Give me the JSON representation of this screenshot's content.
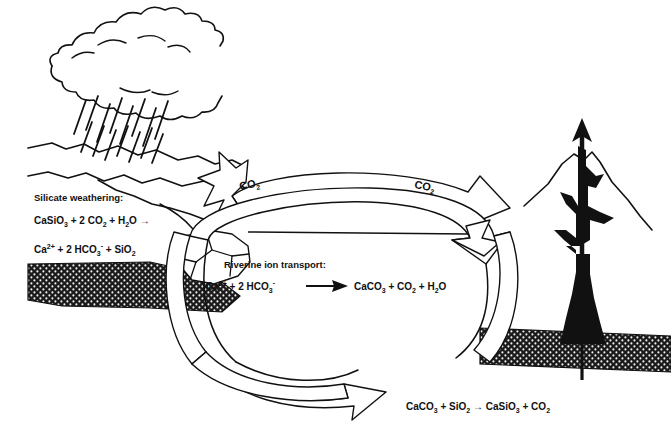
{
  "diagram": {
    "background_color": "#ffffff",
    "ink_color": "#111111"
  },
  "labels": {
    "silicate_weathering_heading": "Silicate weathering:",
    "silicate_eq_line1_a": "CaSiO",
    "silicate_eq_line1_a_sub": "3",
    "silicate_eq_line1_b": " + 2 CO",
    "silicate_eq_line1_b_sub": "2",
    "silicate_eq_line1_c": " + H",
    "silicate_eq_line1_c_sub": "2",
    "silicate_eq_line1_d": "O →",
    "silicate_eq_line2_a": "Ca",
    "silicate_eq_line2_a_sup": "2+",
    "silicate_eq_line2_b": " + 2 HCO",
    "silicate_eq_line2_b_sub": "3",
    "silicate_eq_line2_b_sup": "-",
    "silicate_eq_line2_c": " + SiO",
    "silicate_eq_line2_c_sub": "2",
    "riverine_heading": "Riverine ion transport:",
    "riverine_eq_a": "Ca",
    "riverine_eq_a_sup": "2+",
    "riverine_eq_b": " + 2 HCO",
    "riverine_eq_b_sub": "3",
    "riverine_eq_b_sup": "-",
    "riverine_eq_c": "CaCO",
    "riverine_eq_c_sub": "3",
    "riverine_eq_d": " + CO",
    "riverine_eq_d_sub": "2",
    "riverine_eq_e": " + H",
    "riverine_eq_e_sub": "2",
    "riverine_eq_f": "O",
    "metamorphism_eq_a": "CaCO",
    "metamorphism_eq_a_sub": "3",
    "metamorphism_eq_b": " + SiO",
    "metamorphism_eq_b_sub": "2",
    "metamorphism_eq_c": " → CaSiO",
    "metamorphism_eq_c_sub": "3",
    "metamorphism_eq_d": " + CO",
    "metamorphism_eq_d_sub": "2",
    "co2_left": "CO",
    "co2_left_sub": "2",
    "co2_right": "CO",
    "co2_right_sub": "2"
  },
  "features": {
    "cloud": "rain-cloud",
    "rain": "rain-streaks",
    "land_left": "weathering-landscape",
    "sediment_left": "seafloor-sediment-wedge",
    "sediment_right": "seafloor-sediment-band",
    "outcrop": "cracked-rock-outcrop",
    "volcano": "volcano-with-magma-conduit",
    "outgassing_arrow": "volcanic-outgassing-arrow",
    "sea_level": "sea-level-line",
    "cycle_arrows": "carbon-cycle-loop-arrows"
  }
}
